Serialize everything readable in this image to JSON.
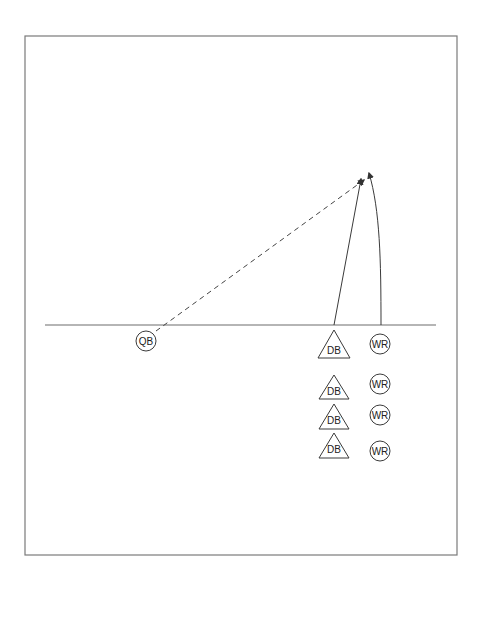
{
  "diagram": {
    "title": "",
    "frame": {
      "x": 25,
      "y": 36,
      "width": 432,
      "height": 519
    },
    "line_of_scrimmage": {
      "x1": 45,
      "x2": 436,
      "y": 325
    },
    "colors": {
      "frame": "#7a7a7a",
      "lines": "#3a3a3a",
      "background": "#ffffff"
    },
    "players": {
      "qb": {
        "label": "QB",
        "shape": "circle",
        "cx": 146,
        "cy": 341,
        "r": 10
      },
      "defenders": [
        {
          "label": "DB",
          "shape": "triangle",
          "cx": 334,
          "apex": 330,
          "base": 358
        },
        {
          "label": "DB",
          "shape": "triangle",
          "cx": 334,
          "apex": 375,
          "base": 399
        },
        {
          "label": "DB",
          "shape": "triangle",
          "cx": 334,
          "apex": 404,
          "base": 429
        },
        {
          "label": "DB",
          "shape": "triangle",
          "cx": 334,
          "apex": 433,
          "base": 458
        }
      ],
      "receivers": [
        {
          "label": "WR",
          "shape": "circle",
          "cx": 380,
          "cy": 344,
          "r": 10
        },
        {
          "label": "WR",
          "shape": "circle",
          "cx": 380,
          "cy": 384,
          "r": 10
        },
        {
          "label": "WR",
          "shape": "circle",
          "cx": 380,
          "cy": 415,
          "r": 10
        },
        {
          "label": "WR",
          "shape": "circle",
          "cx": 380,
          "cy": 451,
          "r": 10
        }
      ]
    },
    "routes": {
      "pass": {
        "type": "dashed-arrow",
        "from": [
          156,
          331
        ],
        "to": [
          364,
          180
        ]
      },
      "db_route": {
        "type": "solid-arrow",
        "from": [
          334,
          325
        ],
        "to": [
          361,
          179
        ]
      },
      "wr_route": {
        "type": "curved-arrow",
        "from": [
          381,
          325
        ],
        "to": [
          369,
          173
        ]
      }
    }
  }
}
